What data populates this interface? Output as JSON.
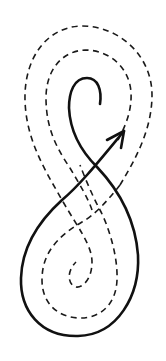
{
  "diagram": {
    "description": "Hand-drawn figure-eight curve with an arrow, surrounded by two dashed spiral contour paths",
    "colors": {
      "background": "#ffffff",
      "stroke": "#111111"
    },
    "elements": {
      "solid_curve": {
        "label": "solid looping curve ending in arrow",
        "style": "solid"
      },
      "arrowhead": {
        "label": "arrowhead pointing up-right",
        "direction": "up-right"
      },
      "outer_dashed_path": {
        "label": "outer dashed spiral path",
        "style": "dashed"
      },
      "inner_dashed_path": {
        "label": "inner dashed spiral path",
        "style": "dashed"
      }
    }
  }
}
